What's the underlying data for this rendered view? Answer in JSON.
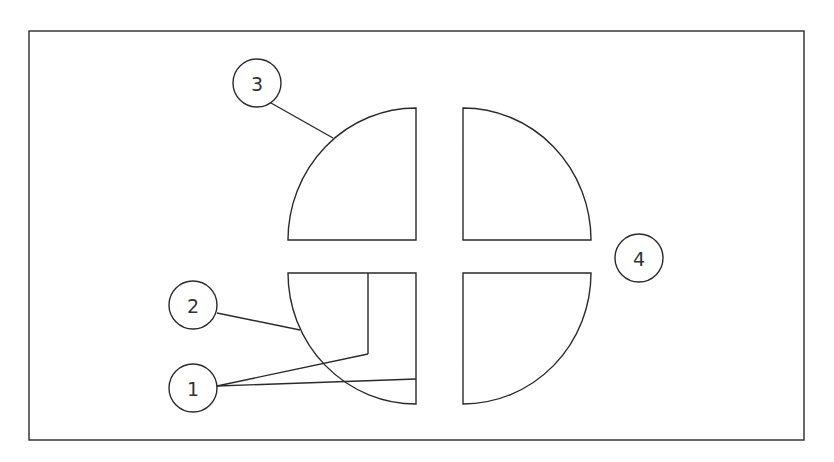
{
  "diagram": {
    "type": "technical-drawing",
    "colors": {
      "line": "#2a2a2a",
      "text": "#333333",
      "background": "#ffffff"
    },
    "frame": {
      "x": 29,
      "y": 31,
      "width": 775,
      "height": 409
    },
    "quadrants": [
      {
        "id": "top-left",
        "corner": "bottom-right"
      },
      {
        "id": "top-right",
        "corner": "bottom-left"
      },
      {
        "id": "bottom-left",
        "corner": "top-right"
      },
      {
        "id": "bottom-right",
        "corner": "top-left"
      }
    ],
    "callouts": [
      {
        "label": "1",
        "cx": 193,
        "cy": 388,
        "targets": [
          "inner bracket line",
          "bottom-left quadrant right edge"
        ]
      },
      {
        "label": "2",
        "cx": 193,
        "cy": 305,
        "targets": [
          "bottom-left quadrant arc"
        ]
      },
      {
        "label": "3",
        "cx": 257,
        "cy": 83,
        "targets": [
          "top-left quadrant arc"
        ]
      },
      {
        "label": "4",
        "cx": 639,
        "cy": 258,
        "targets": [
          "cross-shaped gap"
        ]
      }
    ]
  }
}
